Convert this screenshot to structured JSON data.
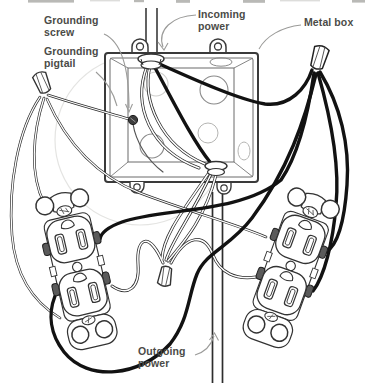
{
  "figure": {
    "type": "wiring-diagram",
    "labels": {
      "grounding_screw": "Grounding screw",
      "grounding_pigtail": "Grounding pigtail",
      "incoming_power": "Incoming power",
      "metal_box": "Metal box",
      "outgoing_power": "Outgoing power"
    },
    "colors": {
      "background": "#ffffff",
      "label_text": "#4b4b47",
      "leader_line": "#9b9b99",
      "line_art": "#333333",
      "hot_wire": "#121212",
      "terminal_screw": "#5a5a5a"
    },
    "components": [
      "metal-box",
      "incoming-cable",
      "outgoing-cable",
      "grounding-screw",
      "grounding-pigtail",
      "wire-nut-ground",
      "wire-nut-hot",
      "wire-nut-neutral",
      "duplex-receptacle-left",
      "duplex-receptacle-right"
    ]
  }
}
